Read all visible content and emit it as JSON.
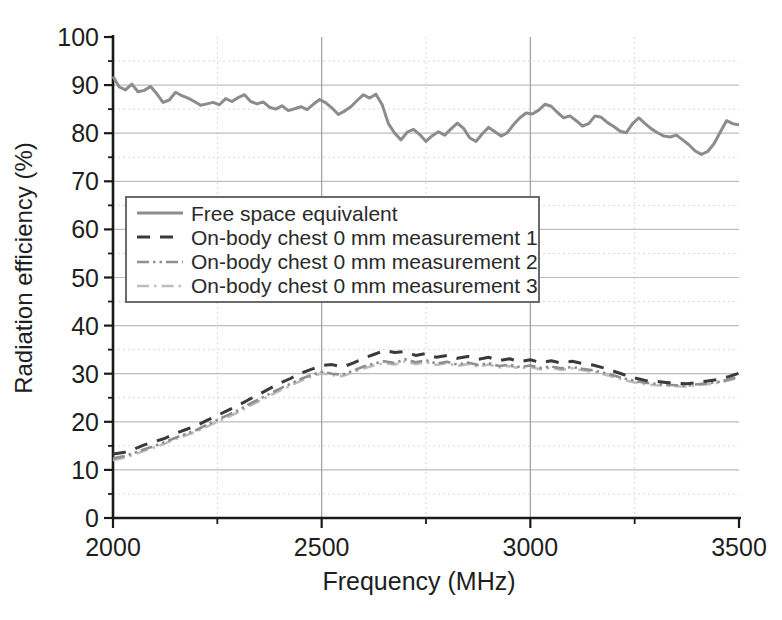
{
  "chart_data": {
    "type": "line",
    "title": "",
    "xlabel": "Frequency (MHz)",
    "ylabel": "Radiation efficiency (%)",
    "xlim": [
      2000,
      3500
    ],
    "ylim": [
      0,
      100
    ],
    "x_major_ticks": [
      2000,
      2500,
      3000,
      3500
    ],
    "x_minor_step": 250,
    "y_major_step": 10,
    "y_minor_step": 5,
    "grid": {
      "major_h_color": "#bdbdbd",
      "major_v_color": "#9f9f9f",
      "minor_color": "#d9d9d9",
      "major_v_lines": [
        2500,
        3000
      ],
      "minor_v_lines": [
        2250,
        2750,
        3250
      ],
      "minor_on": true
    },
    "axis_color": "#1a1a1a",
    "legend_position": "upper-left-inside",
    "series": [
      {
        "name": "Free space equivalent",
        "style": "solid",
        "color": "#8c8c8c",
        "width": 3,
        "dash": "",
        "x0": 2000,
        "dx": 15,
        "values": [
          91.8,
          89.6,
          89.0,
          90.2,
          88.6,
          88.9,
          89.7,
          88.2,
          86.4,
          86.9,
          88.5,
          87.8,
          87.3,
          86.6,
          85.8,
          86.1,
          86.4,
          85.9,
          87.2,
          86.6,
          87.4,
          88.0,
          86.6,
          86.1,
          86.5,
          85.4,
          85.0,
          85.7,
          84.7,
          85.1,
          85.5,
          84.9,
          86.0,
          87.0,
          86.3,
          85.2,
          83.9,
          84.6,
          85.5,
          86.8,
          88.0,
          87.3,
          88.1,
          85.9,
          82.0,
          80.0,
          78.6,
          80.2,
          80.8,
          79.7,
          78.3,
          79.5,
          80.3,
          79.6,
          80.9,
          82.1,
          81.0,
          79.0,
          78.3,
          79.9,
          81.2,
          80.3,
          79.4,
          80.1,
          81.8,
          83.2,
          84.2,
          84.0,
          84.8,
          86.0,
          85.6,
          84.3,
          83.2,
          83.6,
          82.6,
          81.5,
          82.0,
          83.6,
          83.3,
          82.2,
          81.4,
          80.4,
          80.1,
          82.0,
          83.2,
          82.0,
          80.9,
          80.1,
          79.4,
          79.2,
          79.6,
          78.6,
          77.6,
          76.3,
          75.6,
          76.2,
          77.8,
          80.2,
          82.6,
          82.0,
          81.7
        ]
      },
      {
        "name": "On-body chest 0 mm measurement 1",
        "style": "dashed",
        "color": "#3a3a3a",
        "width": 3,
        "dash": "13 10",
        "x0": 2000,
        "dx": 25,
        "values": [
          13.3,
          13.6,
          14.3,
          15.2,
          15.9,
          16.6,
          17.6,
          18.4,
          19.2,
          20.3,
          21.3,
          22.4,
          23.4,
          24.6,
          25.7,
          26.9,
          28.0,
          29.0,
          30.1,
          30.9,
          31.7,
          31.9,
          31.4,
          32.2,
          33.2,
          34.0,
          34.8,
          34.4,
          34.6,
          33.8,
          34.2,
          33.4,
          33.8,
          33.2,
          33.6,
          33.0,
          33.4,
          32.7,
          33.1,
          32.5,
          32.9,
          32.3,
          32.7,
          32.2,
          32.6,
          32.1,
          31.8,
          31.2,
          30.5,
          29.8,
          29.1,
          28.6,
          28.4,
          28.2,
          28.0,
          27.9,
          28.2,
          28.5,
          28.8,
          29.4,
          30.1
        ]
      },
      {
        "name": "On-body chest 0 mm measurement 2",
        "style": "dash-dot-dot",
        "color": "#8f8f8f",
        "width": 2.6,
        "dash": "12 4 2.5 4 2.5 4",
        "x0": 2000,
        "dx": 25,
        "values": [
          12.4,
          12.8,
          13.5,
          14.3,
          15.0,
          15.8,
          16.7,
          17.5,
          18.3,
          19.4,
          20.4,
          21.4,
          22.4,
          23.6,
          24.7,
          25.8,
          26.9,
          27.9,
          28.9,
          29.7,
          30.4,
          30.0,
          29.8,
          30.6,
          31.5,
          32.1,
          32.6,
          32.2,
          33.0,
          32.4,
          32.8,
          32.1,
          32.5,
          31.9,
          32.3,
          31.8,
          32.2,
          31.6,
          31.9,
          31.4,
          31.7,
          31.2,
          31.5,
          31.1,
          31.4,
          31.0,
          30.7,
          30.2,
          29.6,
          29.0,
          28.5,
          28.1,
          27.9,
          27.7,
          27.6,
          27.5,
          27.8,
          28.0,
          28.3,
          28.8,
          29.4
        ]
      },
      {
        "name": "On-body chest 0 mm measurement 3",
        "style": "dash-dot",
        "color": "#bdbdbd",
        "width": 2.6,
        "dash": "12 5 2.5 5",
        "x0": 2000,
        "dx": 25,
        "values": [
          12.0,
          12.5,
          13.2,
          14.0,
          14.7,
          15.5,
          16.4,
          17.2,
          18.0,
          19.0,
          20.0,
          21.0,
          22.0,
          23.2,
          24.3,
          25.4,
          26.5,
          27.5,
          28.5,
          29.4,
          30.1,
          29.7,
          29.5,
          30.3,
          31.1,
          31.7,
          32.2,
          31.9,
          32.6,
          32.0,
          32.4,
          31.8,
          32.2,
          31.6,
          32.0,
          31.5,
          31.9,
          31.3,
          31.6,
          31.1,
          31.4,
          30.9,
          31.2,
          30.8,
          31.1,
          30.7,
          30.4,
          29.9,
          29.3,
          28.7,
          28.2,
          27.8,
          27.6,
          27.5,
          27.4,
          27.3,
          27.6,
          27.8,
          28.1,
          28.6,
          29.2
        ]
      }
    ]
  }
}
